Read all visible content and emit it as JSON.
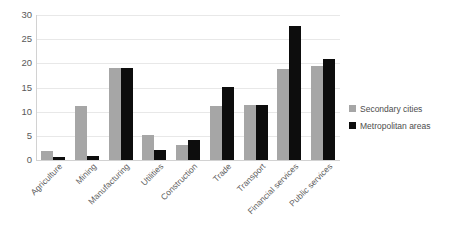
{
  "chart_data": {
    "type": "bar",
    "title": "",
    "subtitle": "",
    "xlabel": "",
    "ylabel": "",
    "ylim": [
      0,
      30
    ],
    "y_ticks": [
      0,
      5,
      10,
      15,
      20,
      25,
      30
    ],
    "grid": true,
    "legend_position": "right",
    "categories": [
      "Agriculture",
      "Mining",
      "Manufacturing",
      "Utilities",
      "Construction",
      "Trade",
      "Transport",
      "Financial services",
      "Public services"
    ],
    "series": [
      {
        "name": "Secondary cities",
        "color": "#a6a6a6",
        "values": [
          1.8,
          11.1,
          19.0,
          5.1,
          3.2,
          11.2,
          11.3,
          18.8,
          19.5
        ]
      },
      {
        "name": "Metropolitan areas",
        "color": "#0d0d0d",
        "values": [
          0.6,
          0.8,
          19.0,
          2.0,
          4.1,
          15.2,
          11.3,
          27.7,
          20.9
        ]
      }
    ]
  },
  "legend": {
    "items": [
      {
        "label": "Secondary cities",
        "swatch": "legend-swatch-secondary-cities"
      },
      {
        "label": "Metropolitan areas",
        "swatch": "legend-swatch-metropolitan-areas"
      }
    ]
  },
  "axes": {
    "y_tick_labels": [
      "30",
      "25",
      "20",
      "15",
      "10",
      "5",
      "0"
    ]
  }
}
